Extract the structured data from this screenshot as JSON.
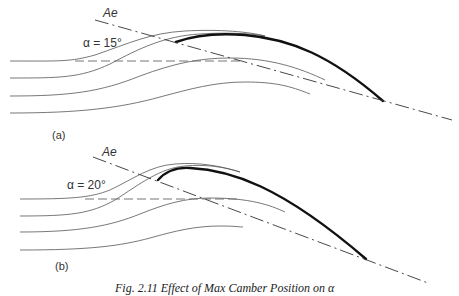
{
  "figure": {
    "caption": "Fig. 2.11  Effect of Max Camber Position on α",
    "panels": [
      {
        "id": "a",
        "label": "(a)",
        "axis_label": "Ae",
        "angle_label": "α = 15°"
      },
      {
        "id": "b",
        "label": "(b)",
        "axis_label": "Ae",
        "angle_label": "α = 20°"
      }
    ]
  },
  "colors": {
    "background": "#ffffff",
    "line": "#111111",
    "text": "#333333"
  }
}
